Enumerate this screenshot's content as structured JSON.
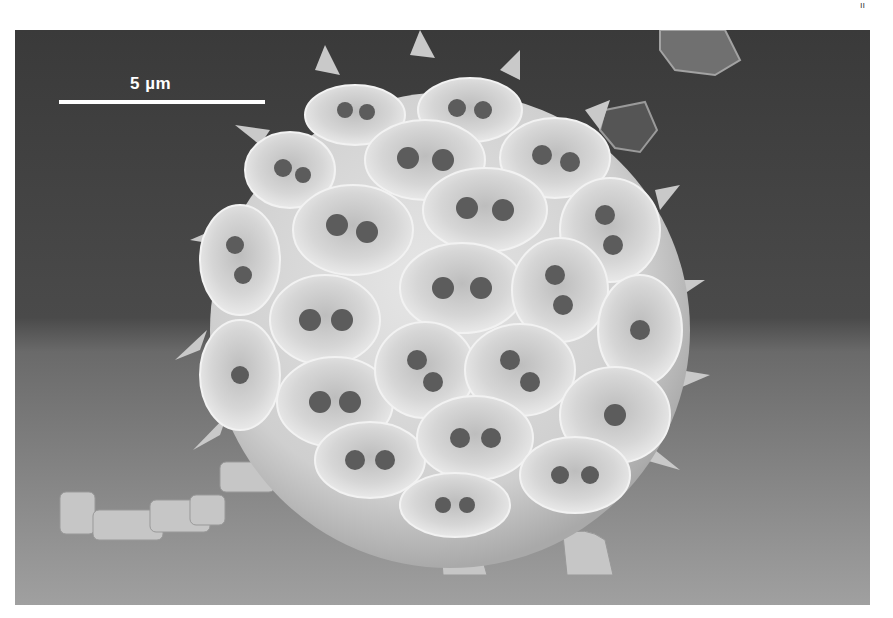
{
  "figure": {
    "type": "scanning electron micrograph",
    "scale_bar": {
      "label": "5 µm",
      "length_px": 206
    },
    "corner_mark": "ıı",
    "colors": {
      "background_top": "#3c3c3c",
      "background_floor": "#8c8c8c",
      "sphere": "#d8d8d8",
      "coccolith_rim": "#e4e4e4",
      "coccolith_hole": "#5a5a5a",
      "scale_bar": "#ffffff"
    }
  }
}
